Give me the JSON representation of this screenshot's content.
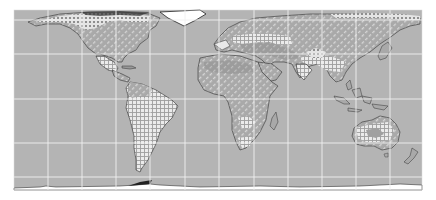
{
  "map": {
    "type": "world-choropleth-hatched",
    "projection": "cylindrical (Miller-like)",
    "extent": {
      "x": 14,
      "y": 10,
      "width": 408,
      "height": 180
    },
    "colors": {
      "background": "#ffffff",
      "ocean": "#b4b4b4",
      "land_base": "#a6a6a6",
      "land_light": "#c2c2c2",
      "gridline": "#f2f2f2",
      "coastline": "#3a3a3a",
      "hatch": "#e6e6e6",
      "antarctica": "#ffffff"
    },
    "gridlines": {
      "meridians_x": [
        48,
        82,
        116,
        150,
        185,
        219,
        254,
        288,
        322,
        356,
        390
      ],
      "parallels_y": [
        20,
        54,
        99,
        143,
        177
      ]
    },
    "pattern_classes": [
      {
        "id": "diag",
        "name": "diagonal-dash-hatch"
      },
      {
        "id": "grid",
        "name": "crosshatch-grid"
      },
      {
        "id": "dots",
        "name": "stippled-dots"
      },
      {
        "id": "dark",
        "name": "darker-diagonal-hatch"
      }
    ]
  }
}
